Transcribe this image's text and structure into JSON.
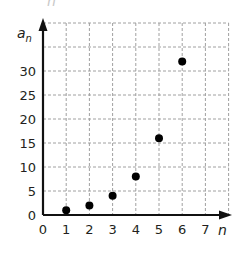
{
  "chart_data": {
    "type": "scatter",
    "title": "",
    "xlabel": "n",
    "ylabel": "a_n",
    "ylabel_main": "a",
    "ylabel_sub": "n",
    "xlim": [
      0,
      8
    ],
    "ylim": [
      0,
      40
    ],
    "grid": true,
    "grid_style": "dashed",
    "x_ticks": [
      "0",
      "1",
      "2",
      "3",
      "4",
      "5",
      "6",
      "7"
    ],
    "y_ticks": [
      "0",
      "5",
      "10",
      "15",
      "20",
      "25",
      "30"
    ],
    "series": [
      {
        "name": "a_n",
        "points": [
          {
            "x": 1,
            "y": 1
          },
          {
            "x": 2,
            "y": 2
          },
          {
            "x": 3,
            "y": 4
          },
          {
            "x": 4,
            "y": 8
          },
          {
            "x": 5,
            "y": 16
          },
          {
            "x": 6,
            "y": 32
          }
        ]
      }
    ],
    "x": [
      1,
      2,
      3,
      4,
      5,
      6
    ],
    "values": [
      1,
      2,
      4,
      8,
      16,
      32
    ],
    "colors": {
      "points": "#000000",
      "axes": "#111111",
      "grid": "#a0a0a0",
      "text": "#231f20"
    }
  },
  "cropped_top_text": "n"
}
